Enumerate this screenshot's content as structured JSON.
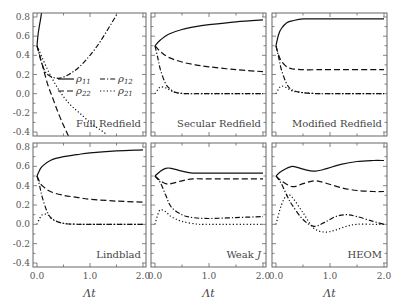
{
  "chart_data": {
    "type": "line",
    "layout": {
      "rows": 2,
      "cols": 3,
      "shared_axes": true,
      "grid": false
    },
    "xlabel": "Λt",
    "xlim": [
      0.0,
      2.0
    ],
    "ylim": [
      -0.4,
      0.8
    ],
    "xticks": [
      "0.0",
      "1.0",
      "2.0"
    ],
    "yticks": [
      "0.8",
      "0.6",
      "0.4",
      "0.2",
      "0.0",
      "-0.2",
      "-0.4"
    ],
    "legend": {
      "panel": "Full Redfield",
      "entries": [
        {
          "label": "ρ11",
          "sub": "11",
          "style": "solid"
        },
        {
          "label": "ρ12",
          "sub": "12",
          "style": "dashdot"
        },
        {
          "label": "ρ22",
          "sub": "22",
          "style": "dashed"
        },
        {
          "label": "ρ21",
          "sub": "21",
          "style": "dotted"
        }
      ]
    },
    "panels": [
      {
        "title": "Full Redfield",
        "series": [
          {
            "name": "ρ11",
            "style": "solid",
            "x": [
              0.0,
              0.02,
              0.05,
              0.08,
              0.1
            ],
            "y": [
              0.5,
              0.62,
              0.72,
              0.82,
              0.9
            ]
          },
          {
            "name": "ρ12",
            "style": "dashdot",
            "x": [
              0.0,
              0.1,
              0.2,
              0.4,
              0.6,
              0.8,
              1.0,
              1.2,
              1.5
            ],
            "y": [
              0.5,
              0.3,
              0.2,
              0.16,
              0.2,
              0.28,
              0.4,
              0.55,
              0.82
            ]
          },
          {
            "name": "ρ22",
            "style": "dashed",
            "x": [
              0.0,
              0.1,
              0.2,
              0.3,
              0.4,
              0.5,
              0.6
            ],
            "y": [
              0.5,
              0.3,
              0.1,
              -0.05,
              -0.2,
              -0.33,
              -0.45
            ]
          },
          {
            "name": "ρ21",
            "style": "dotted",
            "x": [
              0.0,
              0.2,
              0.4,
              0.6,
              0.8,
              1.0,
              1.2,
              1.3
            ],
            "y": [
              0.5,
              0.25,
              0.05,
              -0.1,
              -0.2,
              -0.3,
              -0.38,
              -0.42
            ]
          }
        ]
      },
      {
        "title": "Secular Redfield",
        "series": [
          {
            "name": "ρ11",
            "style": "solid",
            "x": [
              0.0,
              0.1,
              0.25,
              0.5,
              0.75,
              1.0,
              1.5,
              2.0
            ],
            "y": [
              0.5,
              0.56,
              0.62,
              0.67,
              0.7,
              0.72,
              0.75,
              0.77
            ]
          },
          {
            "name": "ρ22",
            "style": "dashed",
            "x": [
              0.0,
              0.1,
              0.25,
              0.5,
              0.75,
              1.0,
              1.5,
              2.0
            ],
            "y": [
              0.5,
              0.44,
              0.38,
              0.33,
              0.3,
              0.28,
              0.25,
              0.23
            ]
          },
          {
            "name": "ρ12",
            "style": "dashdot",
            "x": [
              0.0,
              0.05,
              0.1,
              0.2,
              0.3,
              0.4,
              0.6,
              1.0,
              2.0
            ],
            "y": [
              0.5,
              0.38,
              0.25,
              0.1,
              0.04,
              0.01,
              0.0,
              0.0,
              0.0
            ]
          },
          {
            "name": "ρ21",
            "style": "dotted",
            "x": [
              0.0,
              0.05,
              0.1,
              0.2,
              0.3,
              0.4,
              0.6,
              1.0,
              2.0
            ],
            "y": [
              0.0,
              0.04,
              0.07,
              0.06,
              0.03,
              0.01,
              0.0,
              0.0,
              0.0
            ]
          }
        ]
      },
      {
        "title": "Modified Redfield",
        "series": [
          {
            "name": "ρ11",
            "style": "solid",
            "x": [
              0.0,
              0.05,
              0.1,
              0.2,
              0.3,
              0.5,
              0.8,
              1.0,
              2.0
            ],
            "y": [
              0.5,
              0.62,
              0.68,
              0.74,
              0.76,
              0.78,
              0.78,
              0.78,
              0.78
            ]
          },
          {
            "name": "ρ22",
            "style": "dashed",
            "x": [
              0.0,
              0.05,
              0.1,
              0.2,
              0.3,
              0.5,
              0.8,
              1.0,
              2.0
            ],
            "y": [
              0.5,
              0.4,
              0.34,
              0.28,
              0.26,
              0.25,
              0.25,
              0.25,
              0.25
            ]
          },
          {
            "name": "ρ12",
            "style": "dashdot",
            "x": [
              0.0,
              0.05,
              0.1,
              0.2,
              0.3,
              0.5,
              0.8,
              1.0,
              2.0
            ],
            "y": [
              0.5,
              0.38,
              0.25,
              0.1,
              0.04,
              0.01,
              0.0,
              0.0,
              0.0
            ]
          },
          {
            "name": "ρ21",
            "style": "dotted",
            "x": [
              0.0,
              0.05,
              0.1,
              0.2,
              0.3,
              0.5,
              0.8,
              1.0,
              2.0
            ],
            "y": [
              0.0,
              0.05,
              0.08,
              0.06,
              0.03,
              0.01,
              0.0,
              0.0,
              0.0
            ]
          }
        ]
      },
      {
        "title": "Lindblad",
        "series": [
          {
            "name": "ρ11",
            "style": "solid",
            "x": [
              0.0,
              0.05,
              0.1,
              0.25,
              0.5,
              0.75,
              1.0,
              1.5,
              2.0
            ],
            "y": [
              0.5,
              0.56,
              0.6,
              0.66,
              0.7,
              0.72,
              0.74,
              0.76,
              0.77
            ]
          },
          {
            "name": "ρ22",
            "style": "dashed",
            "x": [
              0.0,
              0.05,
              0.1,
              0.25,
              0.5,
              0.75,
              1.0,
              1.5,
              2.0
            ],
            "y": [
              0.5,
              0.44,
              0.4,
              0.34,
              0.3,
              0.28,
              0.26,
              0.24,
              0.23
            ]
          },
          {
            "name": "ρ12",
            "style": "dashdot",
            "x": [
              0.0,
              0.05,
              0.1,
              0.2,
              0.3,
              0.5,
              0.8,
              1.0,
              2.0
            ],
            "y": [
              0.5,
              0.4,
              0.28,
              0.12,
              0.05,
              0.01,
              0.0,
              0.0,
              0.0
            ]
          },
          {
            "name": "ρ21",
            "style": "dotted",
            "x": [
              0.0,
              0.05,
              0.1,
              0.2,
              0.3,
              0.5,
              0.8,
              1.0,
              2.0
            ],
            "y": [
              0.0,
              0.06,
              0.1,
              0.1,
              0.05,
              0.01,
              0.0,
              0.0,
              0.0
            ]
          }
        ]
      },
      {
        "title": "Weak J",
        "series": [
          {
            "name": "ρ11",
            "style": "solid",
            "x": [
              0.0,
              0.1,
              0.2,
              0.3,
              0.5,
              0.7,
              1.0,
              1.5,
              2.0
            ],
            "y": [
              0.5,
              0.55,
              0.58,
              0.58,
              0.55,
              0.53,
              0.53,
              0.53,
              0.53
            ]
          },
          {
            "name": "ρ22",
            "style": "dashed",
            "x": [
              0.0,
              0.1,
              0.2,
              0.3,
              0.5,
              0.7,
              1.0,
              1.5,
              2.0
            ],
            "y": [
              0.5,
              0.45,
              0.42,
              0.42,
              0.45,
              0.47,
              0.47,
              0.47,
              0.47
            ]
          },
          {
            "name": "ρ12",
            "style": "dashdot",
            "x": [
              0.0,
              0.1,
              0.2,
              0.3,
              0.5,
              0.7,
              1.0,
              1.5,
              2.0
            ],
            "y": [
              0.5,
              0.43,
              0.3,
              0.18,
              0.1,
              0.07,
              0.06,
              0.07,
              0.08
            ]
          },
          {
            "name": "ρ21",
            "style": "dotted",
            "x": [
              0.0,
              0.05,
              0.1,
              0.2,
              0.3,
              0.5,
              0.8,
              1.0,
              2.0
            ],
            "y": [
              0.0,
              0.1,
              0.15,
              0.13,
              0.08,
              0.03,
              0.0,
              0.0,
              0.0
            ]
          }
        ]
      },
      {
        "title": "HEOM",
        "series": [
          {
            "name": "ρ11",
            "style": "solid",
            "x": [
              0.0,
              0.1,
              0.3,
              0.5,
              0.7,
              0.9,
              1.2,
              1.5,
              1.8,
              2.0
            ],
            "y": [
              0.5,
              0.55,
              0.6,
              0.57,
              0.55,
              0.57,
              0.62,
              0.65,
              0.66,
              0.66
            ]
          },
          {
            "name": "ρ22",
            "style": "dashed",
            "x": [
              0.0,
              0.1,
              0.3,
              0.5,
              0.7,
              0.9,
              1.2,
              1.5,
              1.8,
              2.0
            ],
            "y": [
              0.5,
              0.45,
              0.39,
              0.42,
              0.45,
              0.43,
              0.38,
              0.35,
              0.34,
              0.34
            ]
          },
          {
            "name": "ρ12",
            "style": "dashdot",
            "x": [
              0.0,
              0.1,
              0.2,
              0.3,
              0.5,
              0.7,
              0.9,
              1.1,
              1.3,
              1.5,
              1.8,
              2.0
            ],
            "y": [
              0.5,
              0.42,
              0.3,
              0.2,
              0.05,
              -0.02,
              0.02,
              0.08,
              0.1,
              0.08,
              0.03,
              0.0
            ]
          },
          {
            "name": "ρ21",
            "style": "dotted",
            "x": [
              0.0,
              0.1,
              0.2,
              0.3,
              0.5,
              0.7,
              0.9,
              1.1,
              1.3,
              1.5,
              1.8,
              2.0
            ],
            "y": [
              0.0,
              0.2,
              0.3,
              0.28,
              0.12,
              -0.04,
              -0.08,
              -0.06,
              -0.02,
              0.0,
              0.0,
              0.0
            ]
          }
        ]
      }
    ]
  }
}
